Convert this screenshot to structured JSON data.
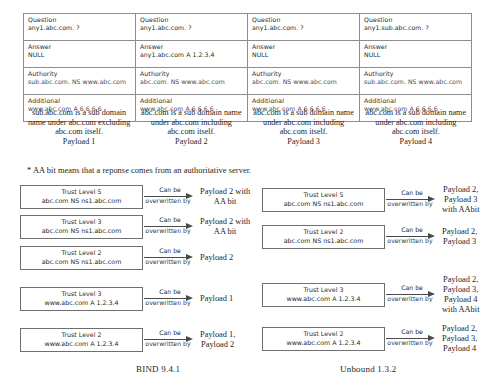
{
  "table": {
    "field_labels": [
      "Question",
      "Answer",
      "Authority",
      "Additional"
    ],
    "columns": [
      {
        "question": "any1.abc.com. ?",
        "answer": "NULL",
        "authority": "sub.abc.com. NS www.abc.com",
        "additional": "www.abc.com A 6.6.6.6"
      },
      {
        "question": "any1.abc.com. ?",
        "answer": "any1.abc.com A 1.2.3.4",
        "authority": "abc.com. NS www.abc.com",
        "additional": "www.abc.com A 6.6.6.6"
      },
      {
        "question": "any1.abc.com. ?",
        "answer": "NULL",
        "authority": "abc.com. NS www.abc.com",
        "additional": "www.abc.com A 6.6.6.6"
      },
      {
        "question": "any1.sub.abc.com. ?",
        "answer": "NULL",
        "authority": "sub.abc.com. NS www.abc.com",
        "additional": "www.abc.com A 6.6.6.6"
      }
    ]
  },
  "descriptions": [
    {
      "line1": "sub.abc.com is a sub domain",
      "line2": "name under abc.com",
      "line3": "excluding abc.com itself.",
      "payload": "Payload 1"
    },
    {
      "line1": "abc.com is a sub domain",
      "line2": "name under abc.com",
      "line3": "including abc.com itself.",
      "payload": "Payload 2"
    },
    {
      "line1": "abc.com is a sub domain",
      "line2": "name under abc.com",
      "line3": "including abc.com itself.",
      "payload": "Payload 3"
    },
    {
      "line1": "abc.com is a sub domain",
      "line2": "name under abc.com",
      "line3": "including abc.com itself.",
      "payload": "Payload 4"
    }
  ],
  "aa_note": "* AA bit means that a reponse comes from an authoritative server.",
  "arrow_label": {
    "top": "Can be",
    "bottom": "overwritten by"
  },
  "bind": {
    "caption": "BIND 9.4.1",
    "rules": [
      {
        "trust_level": "Trust Level 5",
        "record": "abc.com NS ns1.abc.com",
        "result": [
          "Payload 2 with",
          "AA bit"
        ]
      },
      {
        "trust_level": "Trust Level 3",
        "record": "abc.com NS ns1.abc.com",
        "result": [
          "Payload 2 with",
          "AA bit"
        ]
      },
      {
        "trust_level": "Trust Level 2",
        "record": "abc.com NS ns1.abc.com",
        "result": [
          "Payload 2"
        ]
      },
      {
        "trust_level": "Trust Level 3",
        "record": "www.abc.com A 1.2.3.4",
        "result": [
          "Payload 1"
        ]
      },
      {
        "trust_level": "Trust Level 2",
        "record": "www.abc.com A 1.2.3.4",
        "result": [
          "Payload 1,",
          "Payload 2"
        ]
      }
    ]
  },
  "unbound": {
    "caption": "Unbound 1.3.2",
    "rules": [
      {
        "trust_level": "Trust Level 5",
        "record": "abc.com NS ns1.abc.com",
        "result": [
          "Payload 2,",
          "Payload 3",
          "with AAbit"
        ]
      },
      {
        "trust_level": "Trust Level 2",
        "record": "abc.com NS ns1.abc.com",
        "result": [
          "Payload 2,",
          "Payload 3"
        ]
      },
      {
        "trust_level": "Trust Level 3",
        "record": "www.abc.com A 1.2.3.4",
        "result": [
          "Payload 2,",
          "Payload 3,",
          "Payload 4",
          "with AAbit"
        ]
      },
      {
        "trust_level": "Trust Level 2",
        "record": "www.abc.com A 1.2.3.4",
        "result": [
          "Payload 2,",
          "Payload 3,",
          "Payload 4"
        ]
      }
    ]
  }
}
